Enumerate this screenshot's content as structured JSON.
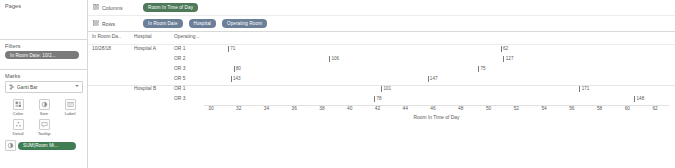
{
  "left_panel": {
    "pages": {
      "title": "Pages"
    },
    "filters": {
      "title": "Filters",
      "pills": [
        {
          "label": "In Room Date: 10/2...",
          "icon": "filter-pill"
        }
      ]
    },
    "marks": {
      "title": "Marks",
      "mark_type": {
        "label": "Gantt Bar",
        "icon": "gantt-bar-icon",
        "caret": "▾"
      },
      "buttons": [
        {
          "label": "Color",
          "icon": "color-icon",
          "glyph": "▒"
        },
        {
          "label": "Size",
          "icon": "size-icon",
          "glyph": "◑"
        },
        {
          "label": "Label",
          "icon": "label-icon",
          "glyph": "☷"
        },
        {
          "label": "Detail",
          "icon": "detail-icon",
          "glyph": "∴"
        },
        {
          "label": "Tooltip",
          "icon": "tooltip-icon",
          "glyph": "⬚"
        }
      ],
      "card_pills": [
        {
          "label": "SUM(Room Mi...",
          "icon": "size-icon",
          "glyph": "◑"
        }
      ]
    }
  },
  "shelves": [
    {
      "name": "Columns",
      "icon": "columns-icon",
      "glyph": "☷",
      "pills": [
        {
          "label": "Room In Time of Day",
          "color": "green"
        }
      ]
    },
    {
      "name": "Rows",
      "icon": "rows-icon",
      "glyph": "☰",
      "pills": [
        {
          "label": "In Room Date",
          "color": "blue"
        },
        {
          "label": "Hospital",
          "color": "blue"
        },
        {
          "label": "Operating Room",
          "color": "blue"
        }
      ]
    }
  ],
  "table": {
    "headers": {
      "date": "In Room Da..",
      "hospital": "Hospital",
      "operating_room": "Operating .."
    },
    "rows": [
      {
        "date": "10/28/18",
        "hospital": "Hospital A",
        "or": "OR 1",
        "value": "71",
        "x": 31.2
      },
      {
        "date": "",
        "hospital": "",
        "or": "OR 2",
        "value": "106",
        "x": 38.4
      },
      {
        "date": "",
        "hospital": "",
        "or": "OR 3",
        "value": "80",
        "x": 31.6
      },
      {
        "date": "",
        "hospital": "",
        "or": "OR 5",
        "value": "143",
        "x": 31.4
      },
      {
        "date": "",
        "hospital": "Hospital B",
        "or": "OR 1",
        "value": "101",
        "x": 42.1
      },
      {
        "date": "",
        "hospital": "",
        "or": "OR 3",
        "value": "78",
        "x": 41.6
      }
    ],
    "extra_marks": [
      {
        "row": 2,
        "value": "75",
        "x": 49.0
      },
      {
        "row": 3,
        "value": "147",
        "x": 45.4
      },
      {
        "row": 0,
        "value": "62",
        "x": 50.6
      },
      {
        "row": 1,
        "value": "127",
        "x": 50.8
      },
      {
        "row": 4,
        "value": "171",
        "x": 56.2
      },
      {
        "row": 5,
        "value": "148",
        "x": 60.1
      }
    ]
  },
  "chart_data": {
    "type": "bar",
    "title": "",
    "xlabel": "Room In Time of Day",
    "ylabel": "",
    "xlim": [
      29.5,
      63
    ],
    "xticks": [
      30,
      32,
      34,
      36,
      38,
      40,
      42,
      44,
      46,
      48,
      50,
      52,
      54,
      56,
      58,
      60,
      62
    ],
    "grid": false,
    "legend": "none",
    "categories": [
      "Hospital A / OR 1",
      "Hospital A / OR 2",
      "Hospital A / OR 3",
      "Hospital A / OR 5",
      "Hospital B / OR 1",
      "Hospital B / OR 3"
    ],
    "marks": [
      {
        "category": "Hospital A / OR 1",
        "x": 31.2,
        "label": "71"
      },
      {
        "category": "Hospital A / OR 1",
        "x": 50.6,
        "label": "62"
      },
      {
        "category": "Hospital A / OR 2",
        "x": 38.4,
        "label": "106"
      },
      {
        "category": "Hospital A / OR 2",
        "x": 50.8,
        "label": "127"
      },
      {
        "category": "Hospital A / OR 3",
        "x": 31.6,
        "label": "80"
      },
      {
        "category": "Hospital A / OR 3",
        "x": 49.0,
        "label": "75"
      },
      {
        "category": "Hospital A / OR 5",
        "x": 31.4,
        "label": "143"
      },
      {
        "category": "Hospital A / OR 5",
        "x": 45.4,
        "label": "147"
      },
      {
        "category": "Hospital B / OR 1",
        "x": 42.1,
        "label": "101"
      },
      {
        "category": "Hospital B / OR 1",
        "x": 56.2,
        "label": "171"
      },
      {
        "category": "Hospital B / OR 3",
        "x": 41.6,
        "label": "78"
      },
      {
        "category": "Hospital B / OR 3",
        "x": 60.1,
        "label": "148"
      }
    ]
  },
  "colors": {
    "pill_blue": "#6b7f99",
    "pill_green": "#4e7a5a",
    "pill_filter": "#7a7a7a",
    "pill_measure": "#3f7d52",
    "mark": "#7b7b7b"
  }
}
